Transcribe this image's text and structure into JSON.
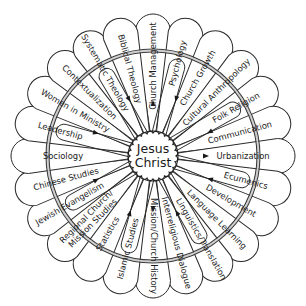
{
  "diagram": {
    "center_label_line1": "Jesus",
    "center_label_line2": "Christ",
    "colors": {
      "stroke": "#2a2a2a",
      "fill": "#ffffff",
      "text": "#1a1a1a",
      "ring_band": "#cfcfcf"
    },
    "petals": [
      {
        "angle": 0,
        "label": "Church Management",
        "loop": false,
        "arrow": "out"
      },
      {
        "angle": 15,
        "label": "Psychology",
        "loop": true,
        "arrow": "in"
      },
      {
        "angle": 30,
        "label": "Church Growth",
        "loop": false,
        "arrow": "none"
      },
      {
        "angle": 45,
        "label": "Cultural Anthropology",
        "loop": false,
        "arrow": "none"
      },
      {
        "angle": 60,
        "label": "Folk Religion",
        "loop": true,
        "arrow": "out"
      },
      {
        "angle": 75,
        "label": "Communication",
        "loop": false,
        "arrow": "none"
      },
      {
        "angle": 90,
        "label": "Urbanization",
        "loop": false,
        "arrow": "out"
      },
      {
        "angle": 105,
        "label": "Ecumenics",
        "loop": true,
        "arrow": "in"
      },
      {
        "angle": 120,
        "label": "Development",
        "loop": false,
        "arrow": "none"
      },
      {
        "angle": 135,
        "label": "Language Learning",
        "loop": false,
        "arrow": "none"
      },
      {
        "angle": 150,
        "label": "Linguistics/Translation",
        "loop": true,
        "arrow": "in"
      },
      {
        "angle": 165,
        "label": "Interreligious Dialogue",
        "loop": false,
        "arrow": "none"
      },
      {
        "angle": 180,
        "label": "Mission/Church History",
        "loop": false,
        "arrow": "out"
      },
      {
        "angle": 195,
        "label": "Islamic Studies",
        "loop": true,
        "arrow": "in"
      },
      {
        "angle": 210,
        "label": "Statistics",
        "loop": false,
        "arrow": "none"
      },
      {
        "angle": 225,
        "label": "Regional Church/ Mission Studies",
        "loop": false,
        "arrow": "none"
      },
      {
        "angle": 240,
        "label": "Jewish Evangelism",
        "loop": true,
        "arrow": "in"
      },
      {
        "angle": 255,
        "label": "Chinese Studies",
        "loop": false,
        "arrow": "none"
      },
      {
        "angle": 270,
        "label": "Sociology",
        "loop": false,
        "arrow": "none"
      },
      {
        "angle": 285,
        "label": "Leadership",
        "loop": true,
        "arrow": "in"
      },
      {
        "angle": 300,
        "label": "Women in Ministry",
        "loop": false,
        "arrow": "none"
      },
      {
        "angle": 315,
        "label": "Contextualization",
        "loop": false,
        "arrow": "none"
      },
      {
        "angle": 330,
        "label": "Systematic Theology",
        "loop": true,
        "arrow": "in"
      },
      {
        "angle": 345,
        "label": "Biblical Theology",
        "loop": false,
        "arrow": "none"
      }
    ]
  }
}
